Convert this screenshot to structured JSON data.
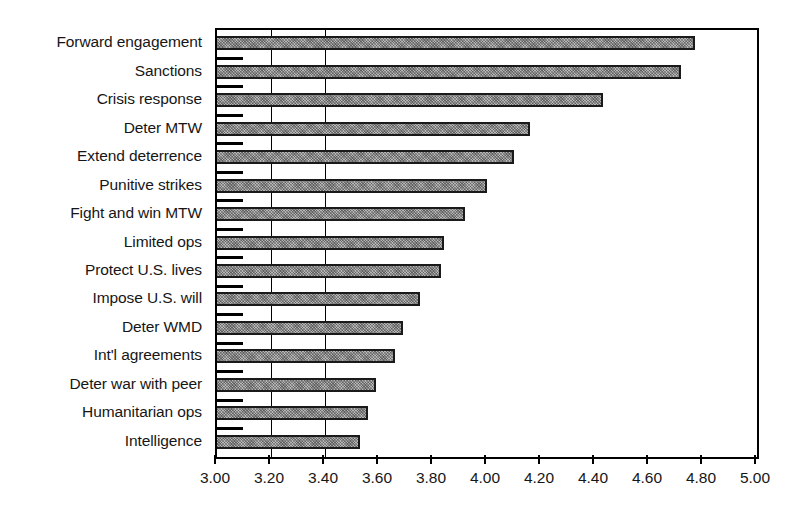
{
  "chart_data": {
    "type": "bar",
    "orientation": "horizontal",
    "title": "",
    "subtitle": "",
    "xlabel": "",
    "ylabel": "",
    "xlim": [
      3.0,
      5.0
    ],
    "xtick_labels": [
      "3.00",
      "3.20",
      "3.40",
      "3.60",
      "3.80",
      "4.00",
      "4.20",
      "4.40",
      "4.60",
      "4.80",
      "5.00"
    ],
    "xtick_values": [
      3.0,
      3.2,
      3.4,
      3.6,
      3.8,
      4.0,
      4.2,
      4.4,
      4.6,
      4.8,
      5.0
    ],
    "grid": "vertical-partial",
    "legend": "none",
    "bar_fill_color": "#8a8a8a",
    "bar_edge_color": "#1a1a1a",
    "axis_color": "#000000",
    "background_color": "#ffffff",
    "categories": [
      "Forward engagement",
      "Sanctions",
      "Crisis response",
      "Deter MTW",
      "Extend deterrence",
      "Punitive strikes",
      "Fight and win MTW",
      "Limited ops",
      "Protect U.S. lives",
      "Impose U.S. will",
      "Deter WMD",
      "Int'l agreements",
      "Deter war with peer",
      "Humanitarian ops",
      "Intelligence"
    ],
    "values": [
      4.77,
      4.72,
      4.43,
      4.16,
      4.1,
      4.0,
      3.92,
      3.84,
      3.83,
      3.75,
      3.69,
      3.66,
      3.59,
      3.56,
      3.53
    ]
  }
}
